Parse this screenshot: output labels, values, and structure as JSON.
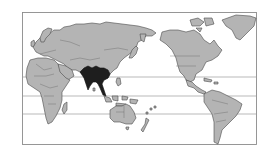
{
  "map": {
    "projection": "Pacific-centered world map",
    "highlighted_region": "South and Southeast Asia",
    "colors": {
      "background": "#ffffff",
      "land": "#b4b4b4",
      "highlight": "#1e1e1e",
      "outline": "#4a4a4a",
      "frame": "#8c8c8c",
      "latitude_lines": "#8a8a8a"
    },
    "latitude_lines": [
      {
        "name": "tropic-of-cancer",
        "y": 77
      },
      {
        "name": "equator",
        "y": 96
      },
      {
        "name": "tropic-of-capricorn",
        "y": 114
      }
    ]
  }
}
